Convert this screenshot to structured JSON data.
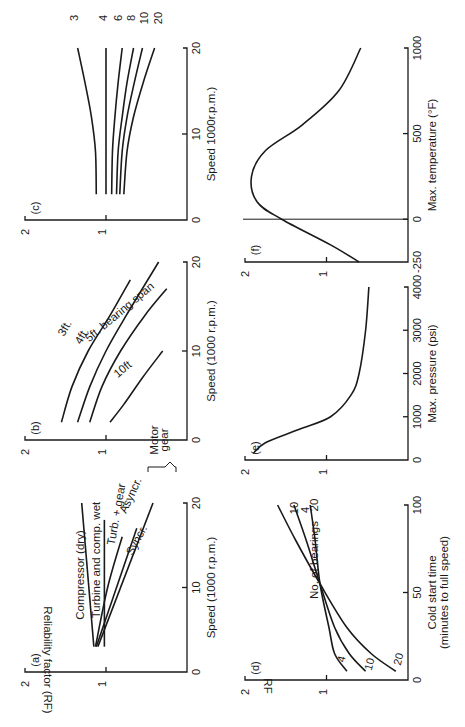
{
  "figure": {
    "rotation_deg": -90,
    "y_axis_label": "Reliability factor (RF)",
    "y_axis_short_label": "RF",
    "colors": {
      "ink": "#1a1a1a",
      "background": "#ffffff"
    }
  },
  "chart_data": [
    {
      "panel": "(a)",
      "type": "line",
      "xlabel": "Speed  (1000 r.p.m.)",
      "ylabel": "Reliability factor (RF)",
      "xlim": [
        0,
        20
      ],
      "ylim": [
        0,
        2
      ],
      "xticks": [
        "0",
        "10",
        "20"
      ],
      "yticks": [
        "1",
        "2"
      ],
      "annotations": [
        "Motor",
        "gear"
      ],
      "series": [
        {
          "name": "Compressor (dry)",
          "x": [
            3,
            20
          ],
          "y": [
            1.15,
            1.3
          ]
        },
        {
          "name": "Turbine and comp. wet",
          "x": [
            3,
            18
          ],
          "y": [
            1.02,
            1.02
          ]
        },
        {
          "name": "Turb. + gear",
          "x": [
            3,
            10,
            16
          ],
          "y": [
            1.13,
            0.98,
            0.8
          ]
        },
        {
          "name": "Asyncr.",
          "x": [
            3,
            17
          ],
          "y": [
            1.12,
            0.62
          ]
        },
        {
          "name": "Syncr.",
          "x": [
            3,
            20
          ],
          "y": [
            1.1,
            0.42
          ]
        }
      ]
    },
    {
      "panel": "(b)",
      "type": "line",
      "xlabel": "Speed  (1000 r.p.m.)",
      "xlim": [
        0,
        20
      ],
      "ylim": [
        0,
        2
      ],
      "xticks": [
        "0",
        "10",
        "20"
      ],
      "yticks": [
        "1",
        "2"
      ],
      "series": [
        {
          "name": "3ft.",
          "x": [
            2,
            6,
            10,
            14,
            18
          ],
          "y": [
            1.55,
            1.42,
            1.22,
            0.95,
            0.7
          ]
        },
        {
          "name": "4ft.",
          "x": [
            2,
            6,
            10,
            14,
            20
          ],
          "y": [
            1.35,
            1.2,
            1.0,
            0.75,
            0.35
          ]
        },
        {
          "name": "5ft. bearing span",
          "x": [
            2,
            6,
            10,
            14,
            17
          ],
          "y": [
            1.2,
            1.05,
            0.82,
            0.52,
            0.25
          ]
        },
        {
          "name": "10ft",
          "x": [
            2,
            4,
            7,
            10
          ],
          "y": [
            0.95,
            0.78,
            0.55,
            0.3
          ]
        }
      ]
    },
    {
      "panel": "(c)",
      "type": "line",
      "xlabel": "Speed  1000r.p.m.)",
      "xlim": [
        0,
        20
      ],
      "ylim": [
        0,
        2
      ],
      "xticks": [
        "0",
        "10",
        "20"
      ],
      "yticks": [
        "1",
        "2"
      ],
      "series": [
        {
          "name": "3",
          "x": [
            3,
            8,
            12,
            16,
            20
          ],
          "y": [
            1.12,
            1.13,
            1.18,
            1.26,
            1.35
          ]
        },
        {
          "name": "4",
          "x": [
            3,
            20
          ],
          "y": [
            1.0,
            1.0
          ]
        },
        {
          "name": "6",
          "x": [
            3,
            8,
            12,
            16,
            20
          ],
          "y": [
            0.93,
            0.92,
            0.89,
            0.85,
            0.8
          ]
        },
        {
          "name": "8",
          "x": [
            3,
            8,
            12,
            16,
            20
          ],
          "y": [
            0.87,
            0.85,
            0.8,
            0.74,
            0.66
          ]
        },
        {
          "name": "10",
          "x": [
            3,
            8,
            12,
            16,
            20
          ],
          "y": [
            0.83,
            0.8,
            0.74,
            0.65,
            0.55
          ]
        },
        {
          "name": "20",
          "x": [
            3,
            8,
            12,
            16,
            20
          ],
          "y": [
            0.78,
            0.74,
            0.66,
            0.54,
            0.4
          ]
        }
      ]
    },
    {
      "panel": "(d)",
      "type": "line",
      "xlabel": "Cold start time\n(minutes to full speed)",
      "ylabel": "RF",
      "xlim": [
        0,
        100
      ],
      "ylim": [
        0,
        2
      ],
      "xticks": [
        "0",
        "50",
        "100"
      ],
      "yticks": [
        "1",
        "2"
      ],
      "legend_title": "No. of bearings",
      "series": [
        {
          "name": "4",
          "x": [
            5,
            15,
            30,
            55,
            80,
            100
          ],
          "y": [
            0.75,
            0.9,
            0.97,
            1.08,
            1.14,
            1.2
          ]
        },
        {
          "name": "10",
          "x": [
            5,
            15,
            30,
            55,
            80,
            100
          ],
          "y": [
            0.52,
            0.72,
            0.9,
            1.08,
            1.25,
            1.4
          ]
        },
        {
          "name": "20",
          "x": [
            5,
            15,
            30,
            55,
            80,
            100
          ],
          "y": [
            0.15,
            0.45,
            0.75,
            1.08,
            1.38,
            1.6
          ]
        }
      ]
    },
    {
      "panel": "(e)",
      "type": "line",
      "xlabel": "Max. pressure  (psi)",
      "xlim": [
        0,
        4000
      ],
      "ylim": [
        0,
        2
      ],
      "xticks": [
        "0",
        "1000",
        "2000",
        "3000",
        "4000"
      ],
      "yticks": [
        "1",
        "2"
      ],
      "series": [
        {
          "name": "pressure",
          "x": [
            150,
            400,
            700,
            1000,
            1500,
            2000,
            3000,
            4000
          ],
          "y": [
            1.9,
            1.75,
            1.35,
            0.95,
            0.7,
            0.6,
            0.52,
            0.48
          ]
        }
      ]
    },
    {
      "panel": "(f)",
      "type": "line",
      "xlabel": "Max. temperature  (°F)",
      "xlim": [
        -250,
        1000
      ],
      "ylim": [
        0,
        2
      ],
      "xticks": [
        "-250",
        "0",
        "500",
        "1000"
      ],
      "yticks": [
        "1",
        "2"
      ],
      "reference_line_x": 0,
      "series": [
        {
          "name": "temperature",
          "x": [
            -250,
            -150,
            0,
            100,
            250,
            400,
            550,
            750,
            1000
          ],
          "y": [
            0.6,
            0.95,
            1.55,
            1.85,
            1.92,
            1.75,
            1.3,
            0.85,
            0.58
          ]
        }
      ]
    }
  ]
}
